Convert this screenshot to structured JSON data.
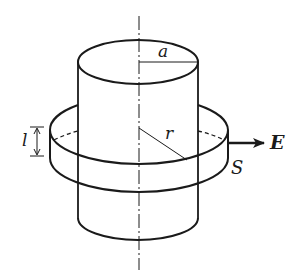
{
  "diagram": {
    "colors": {
      "line": "#1a1a1a",
      "background": "#ffffff"
    },
    "labels": {
      "a": "a",
      "r": "r",
      "l": "l",
      "E": "E",
      "S": "S"
    },
    "elements": {
      "axis": "central axis (dash-dot line)",
      "inner_cylinder": "charged cylinder of radius a",
      "gaussian_surface": "coaxial cylindrical surface S of radius r and height l",
      "field_arrow": "radial electric field vector E"
    }
  }
}
